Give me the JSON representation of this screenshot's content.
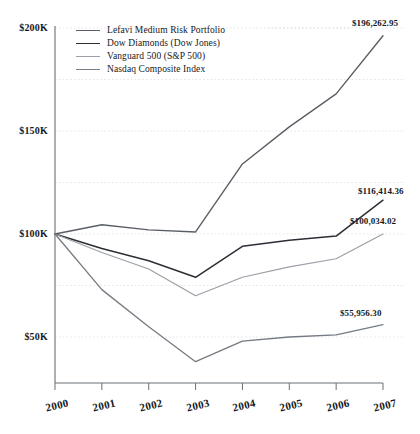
{
  "chart_data": {
    "type": "line",
    "title": "",
    "subtitle": "",
    "xlabel": "",
    "ylabel": "",
    "x": [
      2000,
      2001,
      2002,
      2003,
      2004,
      2005,
      2006,
      2007
    ],
    "categories": [
      "2000",
      "2001",
      "2002",
      "2003",
      "2004",
      "2005",
      "2006",
      "2007"
    ],
    "ylim": [
      25000,
      200000
    ],
    "ytick_values": [
      200000,
      150000,
      100000,
      50000
    ],
    "ytick_labels": [
      "$200K",
      "$150K",
      "$100K",
      "$50K"
    ],
    "minor_gridline_values": [
      175000,
      125000,
      75000
    ],
    "grid": true,
    "legend_position": "top-left",
    "series": [
      {
        "name": "Lefavi Medium Risk Portfolio",
        "color": "#5a5f66",
        "width": 1.4,
        "values": [
          100000,
          104500,
          102000,
          101000,
          134000,
          152000,
          168000,
          196262.95
        ],
        "end_label": "$196,262.95"
      },
      {
        "name": "Dow Diamonds (Dow Jones)",
        "color": "#2b2f35",
        "width": 1.5,
        "values": [
          100000,
          93000,
          87000,
          79000,
          94000,
          97000,
          99000,
          116414.36
        ],
        "end_label": "$116,414.36"
      },
      {
        "name": "Vanguard 500 (S&P 500)",
        "color": "#9aa0a6",
        "width": 1.2,
        "values": [
          100000,
          91000,
          83000,
          70000,
          79000,
          84000,
          88000,
          100034.02
        ],
        "end_label": "$100,034.02"
      },
      {
        "name": "Nasdaq Composite Index",
        "color": "#757b82",
        "width": 1.3,
        "values": [
          100000,
          73000,
          55000,
          38000,
          48000,
          50000,
          51000,
          55956.3
        ],
        "end_label": "$55,956.30"
      }
    ],
    "endpoint_callouts": [
      {
        "text": "$196,262.95",
        "series": "Lefavi Medium Risk Portfolio"
      },
      {
        "text": "$116,414.36",
        "series": "Dow Diamonds (Dow Jones)"
      },
      {
        "text": "$100,034.02",
        "series": "Vanguard 500 (S&P 500)"
      },
      {
        "text": "$55,956.30",
        "series": "Nasdaq Composite Index"
      }
    ]
  },
  "legend": {
    "items": [
      {
        "label": "Lefavi Medium Risk Portfolio"
      },
      {
        "label": "Dow Diamonds (Dow Jones)"
      },
      {
        "label": "Vanguard 500 (S&P 500)"
      },
      {
        "label": "Nasdaq Composite Index"
      }
    ]
  },
  "axes": {
    "y_labels": [
      "$200K",
      "$150K",
      "$100K",
      "$50K"
    ],
    "x_labels": [
      "2000",
      "2001",
      "2002",
      "2003",
      "2004",
      "2005",
      "2006",
      "2007"
    ]
  },
  "colors": {
    "axis": "#6b7075",
    "grid": "#d8dade",
    "text": "#15191d",
    "background": "#ffffff"
  }
}
